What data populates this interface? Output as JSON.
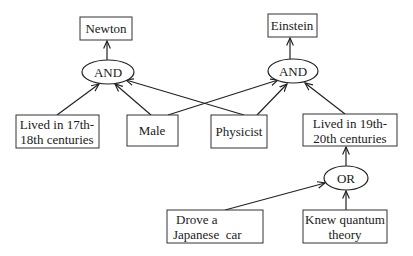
{
  "diagram": {
    "type": "and-or-graph",
    "nodes": {
      "newton": {
        "label": "Newton"
      },
      "einstein": {
        "label": "Einstein"
      },
      "and_left": {
        "label": "AND"
      },
      "and_right": {
        "label": "AND"
      },
      "or": {
        "label": "OR"
      },
      "lived_17_18": {
        "line1": "Lived in 17th-",
        "line2": "18th centuries"
      },
      "male": {
        "label": "Male"
      },
      "physicist": {
        "label": "Physicist"
      },
      "lived_19_20": {
        "line1": "Lived in 19th-",
        "line2": "20th centuries"
      },
      "drove_japanese_car": {
        "line1": "Drove a",
        "line2": "Japanese  car"
      },
      "knew_quantum": {
        "line1": "Knew quantum",
        "line2": "theory"
      }
    },
    "edges": [
      {
        "from": "and_left",
        "to": "newton"
      },
      {
        "from": "and_right",
        "to": "einstein"
      },
      {
        "from": "lived_17_18",
        "to": "and_left"
      },
      {
        "from": "male",
        "to": "and_left"
      },
      {
        "from": "physicist",
        "to": "and_left"
      },
      {
        "from": "male",
        "to": "and_right"
      },
      {
        "from": "physicist",
        "to": "and_right"
      },
      {
        "from": "lived_19_20",
        "to": "and_right"
      },
      {
        "from": "or",
        "to": "lived_19_20"
      },
      {
        "from": "drove_japanese_car",
        "to": "or"
      },
      {
        "from": "knew_quantum",
        "to": "or"
      }
    ]
  }
}
